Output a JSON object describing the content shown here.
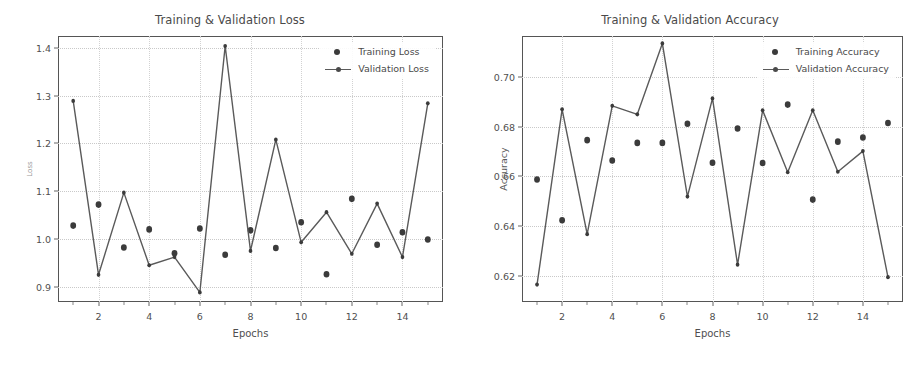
{
  "figure": {
    "background": "#ffffff",
    "marker_color": "#3b3b3b",
    "line_color": "#5a5a5a",
    "grid_color": "#c9c9c9"
  },
  "chart_data": [
    {
      "type": "scatter",
      "title": "Training & Validation Loss",
      "xlabel": "Epochs",
      "ylabel": "Loss",
      "x": [
        1,
        2,
        3,
        4,
        5,
        6,
        7,
        8,
        9,
        10,
        11,
        12,
        13,
        14,
        15
      ],
      "xlim": [
        0.4,
        15.6
      ],
      "ylim": [
        0.868,
        1.425
      ],
      "xticks": [
        2,
        4,
        6,
        8,
        10,
        12,
        14
      ],
      "xtick_labels": [
        "2",
        "4",
        "6",
        "8",
        "10",
        "12",
        "14"
      ],
      "yticks": [
        0.9,
        1.0,
        1.1,
        1.2,
        1.3,
        1.4
      ],
      "ytick_labels": [
        "0.9",
        "1.0",
        "1.1",
        "1.2",
        "1.3",
        "1.4"
      ],
      "grid": true,
      "legend_position": "upper right",
      "series": [
        {
          "name": "Training Loss",
          "style": "markers",
          "values": [
            1.028,
            1.072,
            0.982,
            1.02,
            0.97,
            1.022,
            0.967,
            1.018,
            0.981,
            1.035,
            0.926,
            1.084,
            0.988,
            1.014,
            0.999
          ]
        },
        {
          "name": "Validation Loss",
          "style": "line+markers",
          "values": [
            1.289,
            0.925,
            1.097,
            0.945,
            0.962,
            0.888,
            1.404,
            0.975,
            1.208,
            0.993,
            1.056,
            0.969,
            1.074,
            0.962,
            1.284
          ]
        }
      ]
    },
    {
      "type": "scatter",
      "title": "Training & Validation Accuracy",
      "xlabel": "Epochs",
      "ylabel": "Accuracy",
      "x": [
        1,
        2,
        3,
        4,
        5,
        6,
        7,
        8,
        9,
        10,
        11,
        12,
        13,
        14,
        15
      ],
      "xlim": [
        0.4,
        15.6
      ],
      "ylim": [
        0.6095,
        0.7165
      ],
      "xticks": [
        2,
        4,
        6,
        8,
        10,
        12,
        14
      ],
      "xtick_labels": [
        "2",
        "4",
        "6",
        "8",
        "10",
        "12",
        "14"
      ],
      "yticks": [
        0.62,
        0.64,
        0.66,
        0.68,
        0.7
      ],
      "ytick_labels": [
        "0.62",
        "0.64",
        "0.66",
        "0.68",
        "0.70"
      ],
      "grid": true,
      "legend_position": "upper right",
      "series": [
        {
          "name": "Training Accuracy",
          "style": "markers",
          "values": [
            0.6588,
            0.6424,
            0.6746,
            0.6664,
            0.6735,
            0.6735,
            0.6812,
            0.6655,
            0.6793,
            0.6654,
            0.6889,
            0.6507,
            0.674,
            0.6757,
            0.6815
          ]
        },
        {
          "name": "Validation Accuracy",
          "style": "line+markers",
          "values": [
            0.6165,
            0.687,
            0.6368,
            0.6884,
            0.685,
            0.7135,
            0.6519,
            0.6914,
            0.6245,
            0.6866,
            0.6617,
            0.6866,
            0.6619,
            0.6702,
            0.6195
          ]
        }
      ]
    }
  ]
}
